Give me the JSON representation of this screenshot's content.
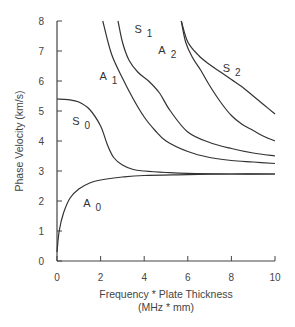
{
  "chart_data": {
    "type": "line",
    "title": "",
    "xlabel": "Frequency * Plate Thickness",
    "xlabel_units": "(MHz * mm)",
    "ylabel": "Phase Velocity (km/s)",
    "xlim": [
      0,
      10
    ],
    "ylim": [
      0,
      8
    ],
    "x_ticks": [
      "0",
      "2",
      "4",
      "6",
      "8",
      "10"
    ],
    "y_ticks": [
      "0",
      "1",
      "2",
      "3",
      "4",
      "5",
      "6",
      "7",
      "8"
    ],
    "grid": false,
    "legend": "inline curve labels",
    "series": [
      {
        "name": "A0",
        "label": "A",
        "sub": "0",
        "x": [
          0.0,
          0.1,
          0.3,
          0.6,
          1.0,
          1.5,
          2.0,
          3.0,
          4.0,
          6.0,
          8.0,
          10.0
        ],
        "y": [
          0.3,
          1.0,
          1.6,
          2.1,
          2.4,
          2.6,
          2.7,
          2.8,
          2.85,
          2.88,
          2.9,
          2.9
        ]
      },
      {
        "name": "S0",
        "label": "S",
        "sub": "0",
        "x": [
          0.0,
          0.5,
          1.0,
          1.5,
          2.0,
          2.3,
          2.6,
          3.0,
          3.5,
          4.0,
          5.0,
          6.0,
          8.0,
          10.0
        ],
        "y": [
          5.4,
          5.38,
          5.3,
          5.05,
          4.5,
          3.9,
          3.45,
          3.2,
          3.05,
          3.0,
          2.95,
          2.92,
          2.9,
          2.9
        ]
      },
      {
        "name": "A1",
        "label": "A",
        "sub": "1",
        "x": [
          2.1,
          2.5,
          3.0,
          3.5,
          4.0,
          4.5,
          5.0,
          6.0,
          7.0,
          8.0,
          9.0,
          10.0
        ],
        "y": [
          8.0,
          6.9,
          6.1,
          5.4,
          4.8,
          4.35,
          4.0,
          3.65,
          3.45,
          3.35,
          3.3,
          3.25
        ]
      },
      {
        "name": "S1",
        "label": "S",
        "sub": "1",
        "x": [
          2.8,
          3.0,
          3.3,
          3.7,
          4.2,
          4.7,
          5.2,
          6.0,
          7.0,
          8.0,
          9.0,
          10.0
        ],
        "y": [
          8.0,
          7.3,
          6.7,
          6.3,
          6.0,
          5.6,
          5.0,
          4.3,
          3.95,
          3.75,
          3.6,
          3.5
        ]
      },
      {
        "name": "A2",
        "label": "A",
        "sub": "2",
        "x": [
          5.7,
          5.9,
          6.2,
          6.6,
          7.0,
          7.5,
          8.0,
          8.5,
          9.0,
          9.5,
          10.0
        ],
        "y": [
          8.0,
          7.3,
          6.8,
          6.35,
          5.85,
          5.3,
          4.85,
          4.55,
          4.35,
          4.15,
          4.0
        ]
      },
      {
        "name": "S2",
        "label": "S",
        "sub": "2",
        "x": [
          5.7,
          6.0,
          6.5,
          7.0,
          7.5,
          8.0,
          8.5,
          9.0,
          9.5,
          10.0
        ],
        "y": [
          8.0,
          7.3,
          6.85,
          6.55,
          6.3,
          6.05,
          5.8,
          5.5,
          5.2,
          4.9
        ]
      }
    ]
  }
}
